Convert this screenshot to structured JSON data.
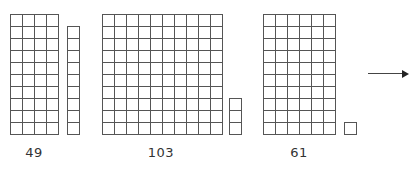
{
  "groups": [
    {
      "id": "group-49",
      "label": "49",
      "tens_block": {
        "cols": 4,
        "rows": 10,
        "x": 10,
        "y": 14
      },
      "ones_column": {
        "cells": 9,
        "x": 67,
        "y": 26
      }
    },
    {
      "id": "group-103",
      "label": "103",
      "tens_block": {
        "cols": 10,
        "rows": 10,
        "x": 102,
        "y": 14
      },
      "ones_column": {
        "cells": 3,
        "x": 229,
        "y": 98
      }
    },
    {
      "id": "group-61",
      "label": "61",
      "tens_block": {
        "cols": 6,
        "rows": 10,
        "x": 263,
        "y": 14
      },
      "ones_column": {
        "cells": 1,
        "x": 344,
        "y": 122
      }
    }
  ],
  "labels": {
    "group_49": "49",
    "group_103": "103",
    "group_61": "61"
  },
  "label_positions": {
    "group_49": 34,
    "group_103": 161,
    "group_61": 299
  },
  "arrow": {
    "direction": "right",
    "icon": "arrow-right-icon"
  },
  "colors": {
    "grid_line": "#555555",
    "text": "#333333",
    "background": "#ffffff"
  }
}
